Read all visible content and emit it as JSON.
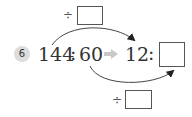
{
  "problem": {
    "number": "6",
    "left_ratio": {
      "first": "144",
      "separator": ":",
      "second": "60"
    },
    "arrow": "➡",
    "right_ratio": {
      "first": "12",
      "separator": ":",
      "second": ""
    },
    "top_operation": {
      "operator": "÷",
      "value": ""
    },
    "bottom_operation": {
      "operator": "÷",
      "value": ""
    }
  },
  "colors": {
    "badge_bg": "#dcdcdc",
    "text": "#333333",
    "arrow_gray": "#c8c8c8",
    "box_border": "#555555"
  }
}
